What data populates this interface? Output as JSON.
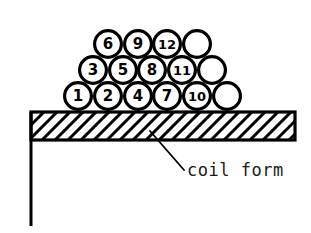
{
  "figure": {
    "background_color": "#ffffff",
    "ink_color": "#000000"
  },
  "annotation": {
    "label": "coil form",
    "leader_from": [
      150,
      131
    ],
    "leader_to": [
      184,
      170
    ]
  },
  "coil_form": {
    "bar": {
      "x": 31,
      "y": 112,
      "width": 264,
      "height": 28
    },
    "hatch_spacing": 13,
    "hatch_angle_deg": 45,
    "left_post": {
      "x": 31,
      "y_top": 112,
      "y_bottom": 226,
      "width": 3
    }
  },
  "chart_data": {
    "type": "diagram",
    "title": "coil form",
    "circle_diameter": 30,
    "rows": [
      {
        "row_index": 0,
        "name": "bottom-row",
        "cy": 96,
        "circles": [
          {
            "label": "1",
            "cx": 78,
            "labeled": true
          },
          {
            "label": "2",
            "cx": 108,
            "labeled": true
          },
          {
            "label": "4",
            "cx": 138,
            "labeled": true
          },
          {
            "label": "7",
            "cx": 167,
            "labeled": true
          },
          {
            "label": "10",
            "cx": 197,
            "labeled": true
          },
          {
            "label": "",
            "cx": 227,
            "labeled": false
          }
        ]
      },
      {
        "row_index": 1,
        "name": "middle-row",
        "cy": 70,
        "circles": [
          {
            "label": "3",
            "cx": 93,
            "labeled": true
          },
          {
            "label": "5",
            "cx": 123,
            "labeled": true
          },
          {
            "label": "8",
            "cx": 152,
            "labeled": true
          },
          {
            "label": "11",
            "cx": 182,
            "labeled": true
          },
          {
            "label": "",
            "cx": 212,
            "labeled": false
          }
        ]
      },
      {
        "row_index": 2,
        "name": "top-row",
        "cy": 44,
        "circles": [
          {
            "label": "6",
            "cx": 108,
            "labeled": true
          },
          {
            "label": "9",
            "cx": 138,
            "labeled": true
          },
          {
            "label": "12",
            "cx": 167,
            "labeled": true
          },
          {
            "label": "",
            "cx": 197,
            "labeled": false
          }
        ]
      }
    ],
    "total_circles": 15,
    "numbered_circles": 12,
    "unnumbered_circles": 3,
    "winding_sequence": [
      1,
      2,
      3,
      4,
      5,
      6,
      7,
      8,
      9,
      10,
      11,
      12
    ]
  }
}
